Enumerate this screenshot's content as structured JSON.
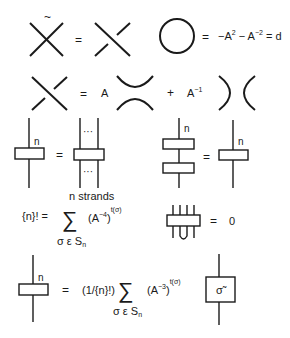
{
  "diagram": {
    "row1": {
      "tilde": "~",
      "equals1": "=",
      "loop_equals": "=",
      "loop_rhs_a": "−A",
      "loop_rhs_exp1": "2",
      "loop_rhs_minus": " − A",
      "loop_rhs_exp2": "−2",
      "loop_rhs_end": " = d"
    },
    "row2": {
      "equals": "=",
      "coef_a": "A",
      "plus": "+",
      "coef_ainv": "A",
      "coef_ainv_exp": "−1"
    },
    "row3": {
      "label_n_left": "n",
      "equals_left": "=",
      "dots_top": "···",
      "dots_bottom": "···",
      "n_strands_caption": "n strands",
      "label_n_stack": "n",
      "equals_right": "=",
      "label_n_single": "n"
    },
    "row4": {
      "qfactorial_lhs": "{n}! =",
      "sum_symbol": "∑",
      "term_base": "(A",
      "term_exp": "−4",
      "term_close": ")",
      "term_outer_exp": "t(σ)",
      "sum_index": "σ ε S",
      "sum_index_sub": "n",
      "kill_equals": "=",
      "kill_rhs": "0"
    },
    "row5": {
      "label_n": "n",
      "equals": "=",
      "prefactor": "(1/{n}!)",
      "sum_symbol": "∑",
      "term_base": "(A",
      "term_exp": "−3",
      "term_close": ")",
      "term_outer_exp": "t(σ)",
      "sum_index": "σ ε S",
      "sum_index_sub": "n",
      "sigma_tilde_label": "σ̃"
    }
  }
}
